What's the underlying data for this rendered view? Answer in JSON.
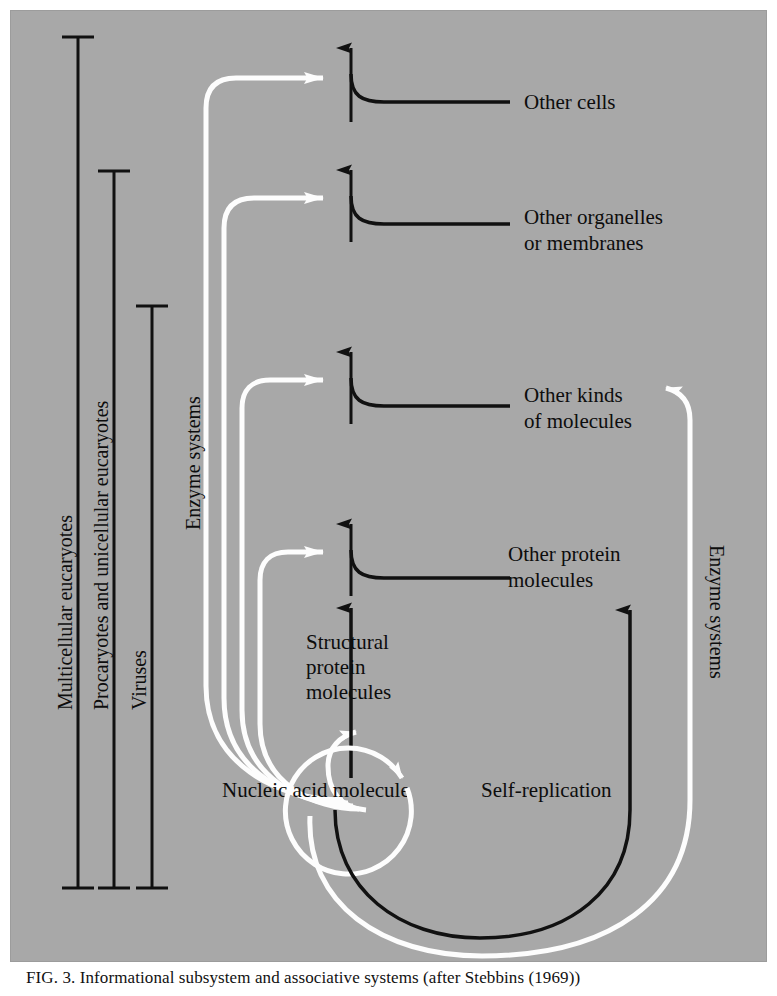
{
  "figure": {
    "caption_label": "FIG. 3.",
    "caption_text": "Informational subsystem and associative systems (after Stebbins (1969))",
    "background_color": "#a8a8a8",
    "ink_black": "#111111",
    "ink_white": "#fdfdfd"
  },
  "brackets": [
    {
      "label": "Multicellular eucaryotes"
    },
    {
      "label": "Procaryotes and unicellular eucaryotes"
    },
    {
      "label": "Viruses"
    }
  ],
  "flow_labels": {
    "enzyme_systems_left": "Enzyme systems",
    "enzyme_systems_right": "Enzyme systems",
    "self_replication": "Self-replication"
  },
  "nodes": [
    {
      "label_line1": "Other cells",
      "label_line2": ""
    },
    {
      "label_line1": "Other organelles",
      "label_line2": "or membranes"
    },
    {
      "label_line1": "Other kinds",
      "label_line2": "of molecules"
    },
    {
      "label_line1": "Other protein",
      "label_line2": "molecules"
    }
  ],
  "center_nodes": [
    {
      "label_line1": "Structural",
      "label_line2": "protein",
      "label_line3": "molecules"
    },
    {
      "label_line1": "Nucleic acid molecule",
      "label_line2": "",
      "label_line3": ""
    }
  ]
}
